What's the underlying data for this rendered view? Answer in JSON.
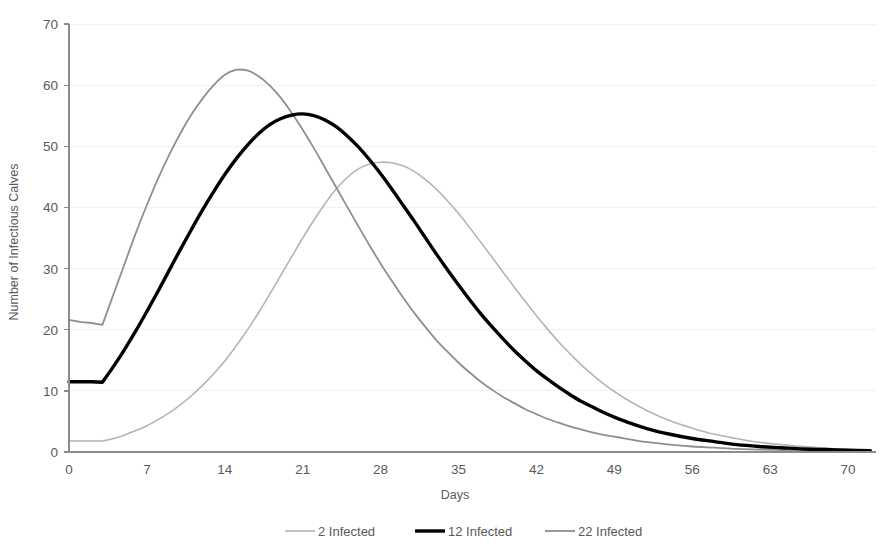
{
  "chart_data": {
    "type": "line",
    "title": "",
    "xlabel": "Days",
    "ylabel": "Number of Infectious Calves",
    "xlim": [
      0,
      72
    ],
    "ylim": [
      0,
      70
    ],
    "xticks": [
      0,
      7,
      14,
      21,
      28,
      35,
      42,
      49,
      56,
      63,
      70
    ],
    "yticks": [
      0,
      10,
      20,
      30,
      40,
      50,
      60,
      70
    ],
    "grid": "horizontal",
    "legend_position": "bottom",
    "x": [
      0,
      1,
      2,
      3,
      4,
      5,
      6,
      7,
      8,
      9,
      10,
      11,
      12,
      13,
      14,
      15,
      16,
      17,
      18,
      19,
      20,
      21,
      22,
      23,
      24,
      25,
      26,
      27,
      28,
      29,
      30,
      31,
      32,
      33,
      34,
      35,
      36,
      37,
      38,
      39,
      40,
      41,
      42,
      43,
      44,
      45,
      46,
      47,
      48,
      49,
      50,
      52,
      54,
      56,
      58,
      60,
      62,
      64,
      66,
      68,
      70,
      72
    ],
    "series": [
      {
        "name": "2 Infected",
        "color": "#b4b4b4",
        "width": 1.6,
        "values": [
          1.8,
          1.8,
          1.8,
          1.8,
          2.2,
          2.8,
          3.5,
          4.3,
          5.3,
          6.4,
          7.7,
          9.2,
          10.9,
          12.8,
          14.9,
          17.3,
          19.9,
          22.7,
          25.7,
          28.8,
          31.9,
          35.0,
          37.9,
          40.6,
          43.0,
          44.9,
          46.3,
          47.1,
          47.4,
          47.3,
          46.8,
          45.9,
          44.6,
          43.0,
          41.1,
          39.0,
          36.7,
          34.3,
          31.9,
          29.4,
          27.0,
          24.6,
          22.3,
          20.1,
          18.0,
          16.1,
          14.3,
          12.7,
          11.2,
          9.9,
          8.7,
          6.7,
          5.1,
          3.9,
          2.9,
          2.2,
          1.6,
          1.2,
          0.9,
          0.6,
          0.4,
          0.3
        ]
      },
      {
        "name": "12 Infected",
        "color": "#000000",
        "width": 3.4,
        "values": [
          11.5,
          11.5,
          11.5,
          11.4,
          14.0,
          16.8,
          19.8,
          23.0,
          26.3,
          29.7,
          33.1,
          36.4,
          39.6,
          42.6,
          45.4,
          47.9,
          50.1,
          52.0,
          53.5,
          54.5,
          55.1,
          55.3,
          55.0,
          54.3,
          53.2,
          51.7,
          49.9,
          47.8,
          45.5,
          43.0,
          40.4,
          37.8,
          35.1,
          32.4,
          29.8,
          27.3,
          24.9,
          22.6,
          20.5,
          18.5,
          16.6,
          14.9,
          13.3,
          11.9,
          10.6,
          9.4,
          8.3,
          7.4,
          6.5,
          5.7,
          5.0,
          3.8,
          2.9,
          2.2,
          1.7,
          1.2,
          0.9,
          0.7,
          0.5,
          0.4,
          0.3,
          0.2
        ]
      },
      {
        "name": "22 Infected",
        "color": "#8f8f8f",
        "width": 1.8,
        "values": [
          21.6,
          21.3,
          21.1,
          20.8,
          25.8,
          30.8,
          35.8,
          40.4,
          44.7,
          48.6,
          52.1,
          55.2,
          57.8,
          60.0,
          61.7,
          62.5,
          62.4,
          61.5,
          60.0,
          58.0,
          55.5,
          52.7,
          49.7,
          46.5,
          43.3,
          40.1,
          36.9,
          33.8,
          30.8,
          28.0,
          25.3,
          22.8,
          20.5,
          18.3,
          16.4,
          14.6,
          13.0,
          11.5,
          10.2,
          9.0,
          8.0,
          7.0,
          6.2,
          5.4,
          4.8,
          4.2,
          3.7,
          3.2,
          2.8,
          2.5,
          2.2,
          1.6,
          1.2,
          0.9,
          0.7,
          0.5,
          0.4,
          0.3,
          0.2,
          0.2,
          0.1,
          0.1
        ]
      }
    ],
    "annotations": [],
    "peaks": [
      {
        "series": "2 Infected",
        "day": 29,
        "value": 47.4
      },
      {
        "series": "12 Infected",
        "day": 21,
        "value": 55.3
      },
      {
        "series": "22 Infected",
        "day": 15,
        "value": 62.5
      }
    ]
  },
  "axis": {
    "y_title": "Number of Infectious Calves",
    "x_title": "Days",
    "y_tick_labels": [
      "0",
      "10",
      "20",
      "30",
      "40",
      "50",
      "60",
      "70"
    ],
    "x_tick_labels": [
      "0",
      "7",
      "14",
      "21",
      "28",
      "35",
      "42",
      "49",
      "56",
      "63",
      "70"
    ]
  },
  "legend": {
    "items": [
      {
        "label": "2 Infected",
        "color": "#b4b4b4"
      },
      {
        "label": "12 Infected",
        "color": "#000000"
      },
      {
        "label": "22 Infected",
        "color": "#8f8f8f"
      }
    ]
  },
  "colors": {
    "grid": "#f1f1f1",
    "axis": "#8c8c8c",
    "text": "#5a5a5a",
    "series_light": "#b4b4b4",
    "series_dark": "#000000",
    "series_mid": "#8f8f8f"
  }
}
